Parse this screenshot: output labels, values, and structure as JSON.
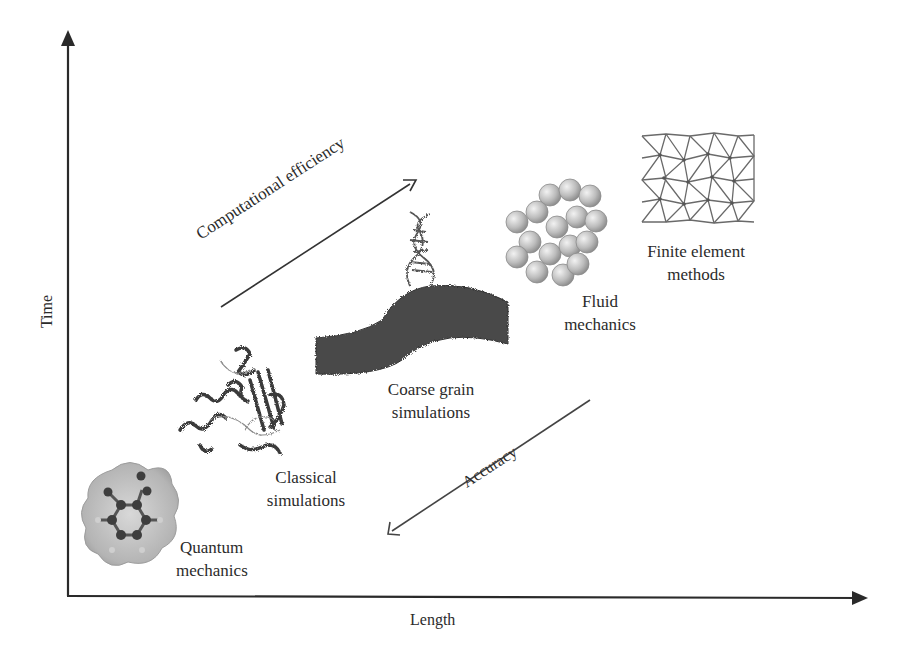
{
  "diagram": {
    "type": "multiscale-modeling-diagram",
    "axes": {
      "x_label": "Length",
      "y_label": "Time"
    },
    "arrows": {
      "up_right": {
        "label": "Computational efficiency"
      },
      "down_left": {
        "label": "Accuracy"
      }
    },
    "methods": [
      {
        "id": "quantum",
        "line1": "Quantum",
        "line2": "mechanics",
        "icon": "benzene-molecule-icon"
      },
      {
        "id": "classical",
        "line1": "Classical",
        "line2": "simulations",
        "icon": "protein-structure-icon"
      },
      {
        "id": "coarse",
        "line1": "Coarse grain",
        "line2": "simulations",
        "icon": "dna-membrane-icon"
      },
      {
        "id": "fluid",
        "line1": "Fluid",
        "line2": "mechanics",
        "icon": "particle-spheres-icon"
      },
      {
        "id": "fem",
        "line1": "Finite element",
        "line2": "methods",
        "icon": "triangular-mesh-icon"
      }
    ],
    "colors": {
      "ink": "#2a2a2a",
      "sphere": "#bdbdbd",
      "membrane": "#4a4a4a"
    }
  }
}
